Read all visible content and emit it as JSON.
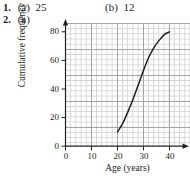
{
  "answers": {
    "q1": {
      "number": "1.",
      "parts": [
        {
          "label": "(a)",
          "value": "25"
        },
        {
          "label": "(b)",
          "value": "12"
        }
      ]
    },
    "q2": {
      "number": "2.",
      "parts": [
        {
          "label": "(a)",
          "value": ""
        }
      ]
    }
  },
  "chart_data": {
    "type": "line",
    "title": "",
    "xlabel": "Age (years)",
    "ylabel": "Cumulative frequency",
    "xlim": [
      0,
      44
    ],
    "ylim": [
      0,
      88
    ],
    "xticks": [
      "0",
      "10",
      "20",
      "30",
      "40"
    ],
    "xtick_values": [
      0,
      10,
      20,
      30,
      40
    ],
    "yticks": [
      "0",
      "20",
      "40",
      "60",
      "80"
    ],
    "ytick_values": [
      0,
      20,
      40,
      60,
      80
    ],
    "grid": true,
    "grid_minor": true,
    "legend": "none",
    "series": [
      {
        "name": "Cumulative frequency curve",
        "x": [
          20,
          22,
          24,
          26,
          28,
          30,
          32,
          34,
          36,
          38,
          40
        ],
        "y": [
          10,
          16,
          24,
          33,
          43,
          53,
          62,
          69,
          74,
          78,
          80
        ]
      }
    ],
    "colors": {
      "curve": "#231f20",
      "axis": "#231f20",
      "grid_major": "#a6a6a6",
      "grid_minor": "#d4d4d4",
      "background": "#ffffff"
    }
  }
}
